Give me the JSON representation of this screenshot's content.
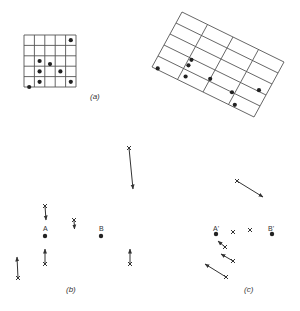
{
  "figure": {
    "panel_a": {
      "caption": "(a)",
      "square_grid": {
        "rows": 5,
        "cols": 5,
        "points_grid_units": [
          [
            4.5,
            0.5
          ],
          [
            1.5,
            2.5
          ],
          [
            2.5,
            2.8
          ],
          [
            1.5,
            3.5
          ],
          [
            3.5,
            3.5
          ],
          [
            1.5,
            4.5
          ],
          [
            4.5,
            4.5
          ],
          [
            0.5,
            5.0
          ]
        ]
      },
      "rotated_grid": {
        "rows": 5,
        "cols": 4,
        "points_grid_units": [
          [
            1.1,
            3.1
          ],
          [
            1.1,
            3.6
          ],
          [
            2.0,
            3.8
          ],
          [
            3.7,
            2.9
          ],
          [
            0.2,
            4.9
          ],
          [
            1.2,
            4.5
          ],
          [
            2.9,
            4.0
          ],
          [
            3.2,
            4.8
          ]
        ]
      }
    },
    "panel_b": {
      "caption": "(b)",
      "labels": {
        "A": "A",
        "B": "B"
      }
    },
    "panel_c": {
      "caption": "(c)",
      "labels": {
        "A": "A'",
        "B": "B'"
      }
    }
  }
}
